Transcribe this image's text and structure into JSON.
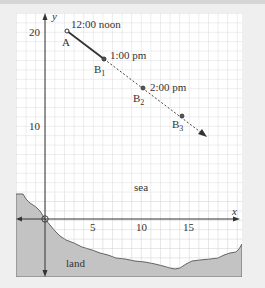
{
  "diagram": {
    "axes": {
      "x_label": "x",
      "y_label": "y",
      "x_ticks": [
        {
          "value": 5,
          "label": "5"
        },
        {
          "value": 10,
          "label": "10"
        },
        {
          "value": 15,
          "label": "15"
        }
      ],
      "y_ticks": [
        {
          "value": 10,
          "label": "10"
        },
        {
          "value": 20,
          "label": "20"
        }
      ]
    },
    "points": [
      {
        "id": "A",
        "label": "A",
        "x": 2,
        "y": 20,
        "time": "12:00 noon"
      },
      {
        "id": "B1",
        "label": "B",
        "sub": "1",
        "x": 6,
        "y": 17,
        "time": "1:00 pm"
      },
      {
        "id": "B2",
        "label": "B",
        "sub": "2",
        "x": 10,
        "y": 14,
        "time": "2:00 pm"
      },
      {
        "id": "B3",
        "label": "B",
        "sub": "3",
        "x": 14,
        "y": 11,
        "time": ""
      }
    ],
    "regions": {
      "sea": "sea",
      "land": "land"
    },
    "colors": {
      "grid_bg": "#ffffff",
      "grid_line": "#c8c8c8",
      "land_fill": "#b9b9b9",
      "ink": "#333333",
      "page_bg": "#efefef"
    }
  }
}
